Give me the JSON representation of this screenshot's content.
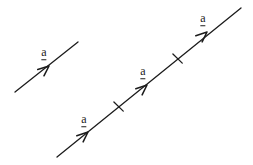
{
  "figure": {
    "background_color": "#ffffff",
    "ink_color": "#1c1c1c",
    "stroke_width": 1.3
  },
  "labels": [
    {
      "id": "label-a-1",
      "text": "a",
      "x": 44,
      "y": 53
    },
    {
      "id": "label-a-2",
      "text": "a",
      "x": 84,
      "y": 120
    },
    {
      "id": "label-a-3",
      "text": "a",
      "x": 143,
      "y": 72
    },
    {
      "id": "label-a-4",
      "text": "a",
      "x": 203,
      "y": 19
    }
  ],
  "chart_data": {
    "type": "diagram",
    "lines": [
      {
        "name": "isolated-vector-line",
        "x1": 15,
        "y1": 92,
        "x2": 78,
        "y2": 42
      },
      {
        "name": "main-collinear-line",
        "x1": 57,
        "y1": 157,
        "x2": 241,
        "y2": 8
      }
    ],
    "arrowheads": [
      {
        "name": "arrowhead-1",
        "x": 49,
        "y": 66,
        "angle_deg": -38
      },
      {
        "name": "arrowhead-2",
        "x": 88,
        "y": 132,
        "angle_deg": -39
      },
      {
        "name": "arrowhead-3",
        "x": 147,
        "y": 85,
        "angle_deg": -39
      },
      {
        "name": "arrowhead-4",
        "x": 207,
        "y": 32,
        "angle_deg": -39
      }
    ],
    "tick_marks": [
      {
        "name": "tick-1",
        "x": 118,
        "y": 107,
        "angle_deg": -39
      },
      {
        "name": "tick-2",
        "x": 177,
        "y": 59,
        "angle_deg": -39
      }
    ],
    "axis_labels": {
      "x": "",
      "y": ""
    },
    "grid": false,
    "legend": false
  }
}
